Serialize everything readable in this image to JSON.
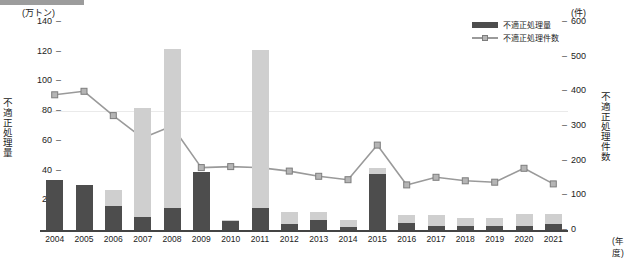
{
  "axes": {
    "left_unit": "(万トン)",
    "right_unit": "(件)",
    "left_title": "不適正処理量",
    "right_title": "不適正処理件数",
    "x_unit": "(年度)",
    "left_ticks": [
      "140",
      "120",
      "100",
      "80",
      "60",
      "40",
      "20",
      "0"
    ],
    "right_ticks": [
      "600",
      "500",
      "400",
      "300",
      "200",
      "100",
      "0"
    ]
  },
  "legend": {
    "bar_label": "不適正処理量",
    "line_label": "不適正処理件数"
  },
  "colors": {
    "bar_dark": "#4d4d4d",
    "bar_light": "#cfcfcf",
    "line": "#9a9a9a",
    "marker": "#b5b5b5",
    "axis": "#444444"
  },
  "chart_data": {
    "type": "bar",
    "title": "",
    "xlabel": "(年度)",
    "ylabel": "不適正処理量",
    "y2label": "不適正処理件数",
    "ylim": [
      0,
      140
    ],
    "y2lim": [
      0,
      600
    ],
    "grid": false,
    "legend_position": "top-right",
    "categories": [
      "2004",
      "2005",
      "2006",
      "2007",
      "2008",
      "2009",
      "2010",
      "2011",
      "2012",
      "2013",
      "2014",
      "2015",
      "2016",
      "2017",
      "2018",
      "2019",
      "2020",
      "2021"
    ],
    "series": [
      {
        "name": "不適正処理量",
        "type": "bar",
        "stacked": true,
        "axis": "left",
        "unit": "万トン",
        "segments": [
          {
            "name": "不適正処理量(下段)",
            "color": "#4d4d4d",
            "values": [
              34,
              30,
              16,
              9,
              15,
              39,
              6,
              15,
              4,
              7,
              2,
              38,
              5,
              3,
              3,
              3,
              3,
              4
            ]
          },
          {
            "name": "不適正処理量(上段)",
            "color": "#cfcfcf",
            "values": [
              0,
              0,
              11,
              73,
              107,
              0,
              1,
              106,
              8,
              5,
              5,
              4,
              5,
              7,
              5,
              5,
              8,
              7
            ]
          }
        ],
        "totals": [
          34,
          30,
          27,
          82,
          122,
          39,
          7,
          121,
          12,
          12,
          7,
          42,
          10,
          10,
          8,
          8,
          11,
          11
        ]
      },
      {
        "name": "不適正処理件数",
        "type": "line",
        "axis": "right",
        "unit": "件",
        "values": [
          390,
          400,
          330,
          265,
          300,
          180,
          183,
          180,
          170,
          155,
          145,
          245,
          130,
          152,
          142,
          138,
          178,
          133
        ]
      }
    ]
  }
}
